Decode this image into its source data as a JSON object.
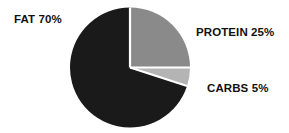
{
  "chart_data": {
    "type": "pie",
    "title": "",
    "subtitle": "",
    "xlabel": "",
    "ylabel": "",
    "legend_position": "none",
    "grid": false,
    "start_angle_deg": 0,
    "direction": "clockwise",
    "categories": [
      "PROTEIN",
      "CARBS",
      "FAT"
    ],
    "values": [
      25,
      5,
      70
    ],
    "units": "%",
    "slices": [
      {
        "name": "PROTEIN",
        "value": 25,
        "label": "PROTEIN 25%",
        "color": "#8a8a8a",
        "start_angle_deg": 0,
        "end_angle_deg": 90
      },
      {
        "name": "CARBS",
        "value": 5,
        "label": "CARBS 5%",
        "color": "#b4b4b4",
        "start_angle_deg": 90,
        "end_angle_deg": 108
      },
      {
        "name": "FAT",
        "value": 70,
        "label": "FAT 70%",
        "color": "#1a1a1a",
        "start_angle_deg": 108,
        "end_angle_deg": 360
      }
    ],
    "annotations": [
      {
        "name": "fat-label",
        "text": "FAT 70%"
      },
      {
        "name": "protein-label",
        "text": "PROTEIN 25%"
      },
      {
        "name": "carbs-label",
        "text": "CARBS 5%"
      }
    ]
  },
  "labels": {
    "fat": "FAT 70%",
    "protein": "PROTEIN 25%",
    "carbs": "CARBS 5%"
  },
  "colors": {
    "background": "#ffffff",
    "fat": "#1a1a1a",
    "protein": "#8a8a8a",
    "carbs": "#b4b4b4",
    "separator": "#ffffff",
    "text": "#111111"
  },
  "geometry": {
    "center_x": 130,
    "center_y": 67.5,
    "radius": 60
  }
}
